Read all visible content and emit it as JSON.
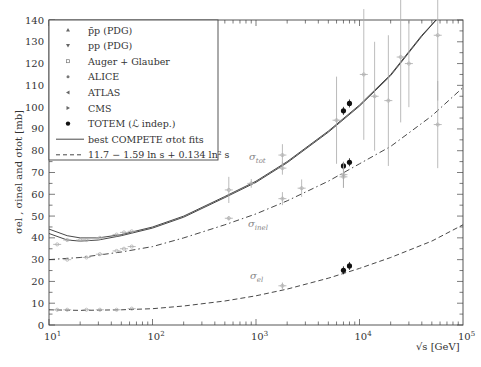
{
  "chart_data": {
    "type": "scatter",
    "title": "",
    "xlabel": "√s  [GeV]",
    "ylabel": "σel , σinel and σtot [mb]",
    "xscale": "log",
    "xlim": [
      10,
      100000
    ],
    "ylim": [
      0,
      140
    ],
    "x_ticks": [
      {
        "value": 10,
        "label": "10",
        "exp": "1"
      },
      {
        "value": 100,
        "label": "10",
        "exp": "2"
      },
      {
        "value": 1000,
        "label": "10",
        "exp": "3"
      },
      {
        "value": 10000,
        "label": "10",
        "exp": "4"
      },
      {
        "value": 100000,
        "label": "10",
        "exp": "5"
      }
    ],
    "y_ticks": [
      0,
      10,
      20,
      30,
      40,
      50,
      60,
      70,
      80,
      90,
      100,
      110,
      120,
      130,
      140
    ],
    "grid": false,
    "legend_position": "upper left",
    "legend": [
      {
        "label": "p̄p (PDG)",
        "marker": "triangle-up"
      },
      {
        "label": "pp (PDG)",
        "marker": "triangle-down"
      },
      {
        "label": "Auger + Glauber",
        "marker": "circle-open"
      },
      {
        "label": "ALICE",
        "marker": "star"
      },
      {
        "label": "ATLAS",
        "marker": "triangle-left"
      },
      {
        "label": "CMS",
        "marker": "triangle-right"
      },
      {
        "label": "TOTEM (ℒ indep.)",
        "marker": "filled-circle"
      },
      {
        "label": "best COMPETE σtot fits",
        "marker": "solid-line"
      },
      {
        "label": "11.7 − 1.59 ln s + 0.134 ln² s",
        "marker": "dashed-line"
      }
    ],
    "curve_labels": [
      {
        "text": "σtot",
        "x": 249,
        "y": 160
      },
      {
        "text": "σinel",
        "x": 248,
        "y": 227
      },
      {
        "text": "σel",
        "x": 250,
        "y": 279
      }
    ],
    "series": [
      {
        "name": "TOTEM (ℒ indep.)",
        "color": "#111111",
        "points": [
          {
            "x": 7000,
            "y": 98.3,
            "type": "tot"
          },
          {
            "x": 8000,
            "y": 101.7,
            "type": "tot"
          },
          {
            "x": 7000,
            "y": 73.0,
            "type": "inel"
          },
          {
            "x": 8000,
            "y": 74.7,
            "type": "inel"
          },
          {
            "x": 7000,
            "y": 25.1,
            "type": "el"
          },
          {
            "x": 8000,
            "y": 27.1,
            "type": "el"
          }
        ]
      },
      {
        "name": "Auger + Glauber",
        "color": "#aaaaaa",
        "points": [
          {
            "x": 57000,
            "y": 133,
            "err": 30,
            "type": "tot"
          },
          {
            "x": 57000,
            "y": 92,
            "err": 20,
            "type": "inel"
          }
        ]
      },
      {
        "name": "Cosmic ray / other σtot",
        "color": "#aaaaaa",
        "points": [
          {
            "x": 6000,
            "y": 94,
            "err": 20,
            "type": "tot"
          },
          {
            "x": 11000,
            "y": 115,
            "err": 30,
            "type": "tot"
          },
          {
            "x": 14000,
            "y": 105,
            "err": 25,
            "type": "tot"
          },
          {
            "x": 19000,
            "y": 103,
            "err": 30,
            "type": "tot"
          },
          {
            "x": 25000,
            "y": 123,
            "err": 30,
            "type": "tot"
          },
          {
            "x": 30000,
            "y": 120,
            "err": 20,
            "type": "tot"
          }
        ]
      },
      {
        "name": "ALICE/ATLAS/CMS σinel",
        "color": "#aaaaaa",
        "points": [
          {
            "x": 2760,
            "y": 62.8,
            "err": 4,
            "type": "inel"
          },
          {
            "x": 7000,
            "y": 69,
            "err": 6,
            "type": "inel"
          },
          {
            "x": 7000,
            "y": 68,
            "err": 5,
            "type": "inel"
          }
        ]
      },
      {
        "name": "p̄p (PDG)",
        "color": "#aaaaaa",
        "points": [
          {
            "x": 546,
            "y": 62,
            "err": 6,
            "type": "tot"
          },
          {
            "x": 900,
            "y": 65,
            "err": 2,
            "type": "tot"
          },
          {
            "x": 1800,
            "y": 78,
            "err": 5,
            "type": "tot"
          },
          {
            "x": 1800,
            "y": 72,
            "err": 3,
            "type": "tot"
          },
          {
            "x": 546,
            "y": 49,
            "err": 1,
            "type": "inel"
          },
          {
            "x": 1800,
            "y": 58,
            "err": 3,
            "type": "inel"
          },
          {
            "x": 1800,
            "y": 18,
            "err": 1.5,
            "type": "el"
          }
        ]
      },
      {
        "name": "pp (PDG) ISR",
        "color": "#aaaaaa",
        "points": [
          {
            "x": 15,
            "y": 39,
            "type": "tot"
          },
          {
            "x": 20,
            "y": 39,
            "type": "tot"
          },
          {
            "x": 23,
            "y": 39,
            "type": "tot"
          },
          {
            "x": 31,
            "y": 40,
            "type": "tot"
          },
          {
            "x": 45,
            "y": 41.5,
            "type": "tot"
          },
          {
            "x": 53,
            "y": 42.5,
            "type": "tot"
          },
          {
            "x": 63,
            "y": 43,
            "type": "tot"
          },
          {
            "x": 12,
            "y": 37,
            "type": "tot"
          },
          {
            "x": 15,
            "y": 30,
            "type": "inel"
          },
          {
            "x": 23,
            "y": 31,
            "type": "inel"
          },
          {
            "x": 31,
            "y": 32.5,
            "type": "inel"
          },
          {
            "x": 45,
            "y": 34,
            "type": "inel"
          },
          {
            "x": 53,
            "y": 35,
            "type": "inel"
          },
          {
            "x": 63,
            "y": 36,
            "type": "inel"
          },
          {
            "x": 12,
            "y": 7,
            "type": "el"
          },
          {
            "x": 15,
            "y": 7,
            "type": "el"
          },
          {
            "x": 23,
            "y": 7,
            "type": "el"
          },
          {
            "x": 31,
            "y": 7,
            "type": "el"
          },
          {
            "x": 45,
            "y": 7,
            "type": "el"
          },
          {
            "x": 63,
            "y": 7.5,
            "type": "el"
          }
        ]
      }
    ],
    "curves": [
      {
        "name": "best COMPETE σtot fits (upper)",
        "style": "solid",
        "points": [
          [
            10,
            44
          ],
          [
            15,
            41
          ],
          [
            20,
            40
          ],
          [
            30,
            40
          ],
          [
            50,
            41.5
          ],
          [
            100,
            45
          ],
          [
            200,
            50
          ],
          [
            500,
            59
          ],
          [
            1000,
            66
          ],
          [
            2000,
            75
          ],
          [
            5000,
            89
          ],
          [
            10000,
            101
          ],
          [
            20000,
            115
          ],
          [
            40000,
            133
          ],
          [
            55000,
            140
          ]
        ]
      },
      {
        "name": "best COMPETE σtot fits (lower)",
        "style": "solid",
        "points": [
          [
            10,
            42
          ],
          [
            15,
            39
          ],
          [
            20,
            38.5
          ],
          [
            30,
            39
          ],
          [
            50,
            41
          ],
          [
            100,
            44.5
          ],
          [
            200,
            49.5
          ],
          [
            500,
            58.5
          ],
          [
            1000,
            65.5
          ],
          [
            2000,
            74.5
          ],
          [
            5000,
            88.5
          ],
          [
            10000,
            100.5
          ],
          [
            20000,
            114.5
          ],
          [
            40000,
            132.5
          ],
          [
            55000,
            140
          ]
        ]
      },
      {
        "name": "σinel fit (dash-dot)",
        "style": "dashdot",
        "points": [
          [
            10,
            30
          ],
          [
            20,
            31
          ],
          [
            50,
            33.5
          ],
          [
            100,
            36
          ],
          [
            200,
            40
          ],
          [
            500,
            46
          ],
          [
            1000,
            51
          ],
          [
            2000,
            57
          ],
          [
            5000,
            66
          ],
          [
            10000,
            74
          ],
          [
            20000,
            82
          ],
          [
            50000,
            96
          ],
          [
            100000,
            109
          ]
        ]
      },
      {
        "name": "11.7 − 1.59 ln s + 0.134 ln² s",
        "style": "dashed",
        "points": [
          [
            10,
            7
          ],
          [
            20,
            6.7
          ],
          [
            50,
            7
          ],
          [
            100,
            7.5
          ],
          [
            200,
            8.7
          ],
          [
            500,
            11
          ],
          [
            1000,
            13.4
          ],
          [
            2000,
            16.5
          ],
          [
            5000,
            21.5
          ],
          [
            10000,
            26
          ],
          [
            20000,
            31
          ],
          [
            50000,
            38.5
          ],
          [
            100000,
            46
          ]
        ]
      }
    ]
  }
}
